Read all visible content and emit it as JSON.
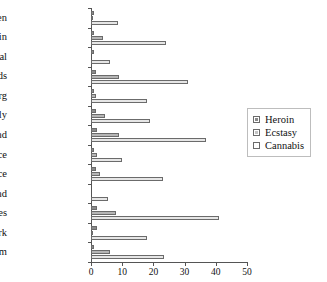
{
  "chart_data": {
    "type": "bar",
    "orientation": "horizontal",
    "title": "",
    "xlabel": "",
    "ylabel": "",
    "xlim": [
      0,
      50
    ],
    "xticks": [
      0,
      10,
      20,
      30,
      40,
      50
    ],
    "grid": false,
    "legend_position": "right",
    "categories": [
      "Sweden",
      "Spain",
      "Portugal",
      "Netherlands",
      "Luxembourg",
      "Italy",
      "Ireland",
      "Greece",
      "France",
      "Finland",
      "England and Wales",
      "Denmark",
      "Belgium"
    ],
    "series": [
      {
        "name": "Heroin",
        "color": "#8a8a8a",
        "values": [
          1.0,
          1.0,
          1.0,
          1.5,
          1.0,
          1.5,
          2.0,
          1.0,
          1.5,
          0.0,
          2.0,
          2.0,
          1.0
        ]
      },
      {
        "name": "Ecstasy",
        "color": "#b5b5b5",
        "values": [
          0.5,
          4.0,
          0.0,
          9.0,
          1.5,
          4.5,
          9.0,
          2.0,
          3.0,
          0.0,
          8.0,
          0.5,
          6.0
        ]
      },
      {
        "name": "Cannabis",
        "color": "#e6e6e6",
        "values": [
          8.5,
          24.0,
          6.0,
          31.0,
          18.0,
          19.0,
          37.0,
          10.0,
          23.0,
          5.5,
          41.0,
          18.0,
          23.5
        ]
      }
    ]
  }
}
